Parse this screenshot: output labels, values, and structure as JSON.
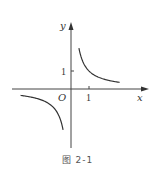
{
  "caption": "图 2-1",
  "axes": {
    "x_label": "x",
    "y_label": "y",
    "origin_label": "O",
    "x_tick_label": "1",
    "y_tick_label": "1"
  },
  "colors": {
    "axis": "#444444",
    "curve": "#333333",
    "text": "#333333"
  },
  "chart_data": {
    "type": "line",
    "title": "",
    "caption": "图 2-1",
    "xlabel": "x",
    "ylabel": "y",
    "function": "y = 1/x",
    "grid": false,
    "legend": null,
    "xlim": [
      -3.3,
      4.3
    ],
    "ylim": [
      -3.3,
      3.6
    ],
    "ticks": {
      "x": [
        1
      ],
      "y": [
        1
      ]
    },
    "annotations": [
      "O"
    ],
    "series": [
      {
        "name": "branch-quadrant-I",
        "x": [
          0.44,
          0.6,
          0.8,
          1.0,
          1.5,
          2.0,
          2.7
        ],
        "y": [
          2.27,
          1.67,
          1.25,
          1.0,
          0.67,
          0.5,
          0.37
        ]
      },
      {
        "name": "branch-quadrant-III",
        "x": [
          -2.8,
          -2.0,
          -1.5,
          -1.0,
          -0.8,
          -0.6,
          -0.44
        ],
        "y": [
          -0.36,
          -0.5,
          -0.67,
          -1.0,
          -1.25,
          -1.67,
          -2.27
        ]
      }
    ]
  }
}
